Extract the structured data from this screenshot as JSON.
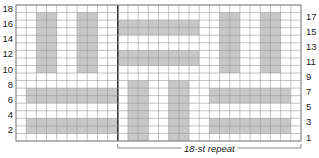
{
  "chart_data": {
    "type": "heatmap",
    "title": "",
    "columns": 28,
    "rows": 18,
    "row_label_side": {
      "left": "even",
      "right": "odd"
    },
    "left_row_labels": [
      "2",
      "4",
      "6",
      "8",
      "10",
      "12",
      "14",
      "16",
      "18"
    ],
    "right_row_labels": [
      "1",
      "3",
      "5",
      "7",
      "9",
      "11",
      "13",
      "15",
      "17"
    ],
    "repeat": {
      "label": "18-st repeat",
      "start_col": 11,
      "end_col": 28
    },
    "colors": {
      "shaded": "#c8c8c8",
      "grid": "#9a9a9a",
      "divider": "#333333",
      "background": "#ffffff"
    },
    "legend": "none",
    "shaded_blocks": [
      {
        "cols": [
          3,
          4
        ],
        "rows": [
          10,
          17
        ]
      },
      {
        "cols": [
          7,
          8
        ],
        "rows": [
          10,
          17
        ]
      },
      {
        "cols": [
          2,
          10
        ],
        "rows": [
          6,
          7
        ]
      },
      {
        "cols": [
          2,
          10
        ],
        "rows": [
          2,
          3
        ]
      },
      {
        "cols": [
          11,
          18
        ],
        "rows": [
          15,
          16
        ]
      },
      {
        "cols": [
          11,
          18
        ],
        "rows": [
          11,
          12
        ]
      },
      {
        "cols": [
          12,
          13
        ],
        "rows": [
          1,
          8
        ]
      },
      {
        "cols": [
          16,
          17
        ],
        "rows": [
          1,
          8
        ]
      },
      {
        "cols": [
          21,
          22
        ],
        "rows": [
          10,
          17
        ]
      },
      {
        "cols": [
          25,
          26
        ],
        "rows": [
          10,
          17
        ]
      },
      {
        "cols": [
          20,
          27
        ],
        "rows": [
          6,
          7
        ]
      },
      {
        "cols": [
          20,
          27
        ],
        "rows": [
          2,
          3
        ]
      }
    ]
  }
}
